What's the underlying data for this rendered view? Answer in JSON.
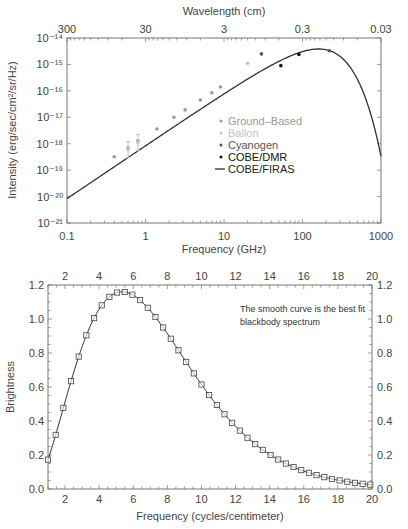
{
  "chart_data": [
    {
      "type": "scatter",
      "title": "",
      "xlabel": "Frequency (GHz)",
      "ylabel": "Intensity (erg/sec/cm²/sr/Hz)",
      "top_xlabel": "Wavelength (cm)",
      "xscale": "log",
      "yscale": "log",
      "xlim": [
        0.1,
        1000
      ],
      "ylim": [
        1e-21,
        1e-14
      ],
      "x_tick_labels": [
        "0.1",
        "1",
        "10",
        "100",
        "1000"
      ],
      "x_ticks": [
        0.1,
        1,
        10,
        100,
        1000
      ],
      "top_tick_labels": [
        "300",
        "30",
        "3",
        "0.3",
        "0.03"
      ],
      "top_ticks_wavelength_cm": [
        300,
        30,
        3,
        0.3,
        0.03
      ],
      "y_tick_labels": [
        "10⁻¹⁴",
        "10⁻¹⁵",
        "10⁻¹⁶",
        "10⁻¹⁷",
        "10⁻¹⁸",
        "10⁻¹⁹",
        "10⁻²⁰",
        "10⁻²¹"
      ],
      "y_ticks_exp": [
        -14,
        -15,
        -16,
        -17,
        -18,
        -19,
        -20,
        -21
      ],
      "legend_position": "center-right",
      "legend": [
        {
          "name": "Ground–Based",
          "marker": "dot",
          "color": "#9a9a9a"
        },
        {
          "name": "Ballon",
          "marker": "dot",
          "color": "#c4c4c4"
        },
        {
          "name": "Cyanogen",
          "marker": "dot",
          "color": "#555555"
        },
        {
          "name": "COBE/DMR",
          "marker": "dot",
          "color": "#111111"
        },
        {
          "name": "COBE/FIRAS",
          "marker": "line",
          "color": "#333333"
        }
      ],
      "series": [
        {
          "name": "COBE/FIRAS",
          "kind": "curve",
          "temperature_K": 2.725,
          "description": "Blackbody curve, peak near 160 GHz"
        },
        {
          "name": "Ground–Based",
          "points": [
            {
              "x": 0.4,
              "y": 3.2e-19
            },
            {
              "x": 0.6,
              "y": 7e-19
            },
            {
              "x": 0.8,
              "y": 1.3e-18
            },
            {
              "x": 1.4,
              "y": 3.6e-18
            },
            {
              "x": 2.3,
              "y": 1e-17
            },
            {
              "x": 3.2,
              "y": 1.9e-17
            },
            {
              "x": 5.0,
              "y": 4.5e-17
            },
            {
              "x": 7.0,
              "y": 8.5e-17
            },
            {
              "x": 9.0,
              "y": 1.4e-16
            }
          ]
        },
        {
          "name": "Ballon",
          "points": [
            {
              "x": 0.6,
              "y": 6e-19,
              "err": true
            },
            {
              "x": 0.8,
              "y": 1.1e-18,
              "err": true
            },
            {
              "x": 20,
              "y": 1.1e-15
            }
          ]
        },
        {
          "name": "Cyanogen",
          "points": [
            {
              "x": 30,
              "y": 2.5e-15
            },
            {
              "x": 220,
              "y": 3.3e-15
            }
          ]
        },
        {
          "name": "COBE/DMR",
          "points": [
            {
              "x": 53,
              "y": 9e-16
            },
            {
              "x": 90,
              "y": 2.4e-15
            }
          ]
        }
      ]
    },
    {
      "type": "line",
      "title": "",
      "xlabel": "Frequency (cycles/centimeter)",
      "ylabel": "Brightness",
      "xlim": [
        1,
        20
      ],
      "ylim": [
        0.0,
        1.2
      ],
      "x_tick_labels": [
        "2",
        "4",
        "6",
        "8",
        "10",
        "12",
        "14",
        "16",
        "18",
        "20"
      ],
      "x_ticks": [
        2,
        4,
        6,
        8,
        10,
        12,
        14,
        16,
        18,
        20
      ],
      "y_tick_labels": [
        "0.0",
        "0.2",
        "0.4",
        "0.6",
        "0.8",
        "1.0",
        "1.2"
      ],
      "y_ticks": [
        0.0,
        0.2,
        0.4,
        0.6,
        0.8,
        1.0,
        1.2
      ],
      "annotation": [
        "The smooth curve is the best fit",
        "blackbody spectrum"
      ],
      "series": [
        {
          "name": "Best-fit blackbody",
          "kind": "curve",
          "temperature_K": 2.725
        },
        {
          "name": "FIRAS data",
          "marker": "square",
          "x": [
            1.0,
            1.45,
            1.9,
            2.35,
            2.8,
            3.25,
            3.7,
            4.15,
            4.6,
            5.05,
            5.5,
            5.95,
            6.4,
            6.85,
            7.3,
            7.75,
            8.2,
            8.65,
            9.1,
            9.55,
            10.0,
            10.45,
            10.9,
            11.35,
            11.8,
            12.25,
            12.7,
            13.15,
            13.6,
            14.05,
            14.5,
            14.95,
            15.4,
            15.85,
            16.3,
            16.75,
            17.2,
            17.65,
            18.1,
            18.55,
            19.0,
            19.45,
            19.9
          ],
          "y": "computed from best-fit blackbody"
        }
      ]
    }
  ]
}
